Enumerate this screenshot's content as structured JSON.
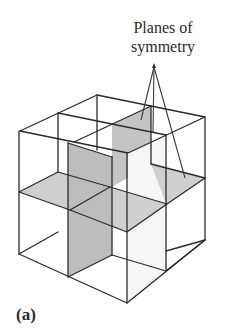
{
  "figure": {
    "annotation_line1": "Planes of",
    "annotation_line2": "symmetry",
    "panel_label": "(a)"
  },
  "colors": {
    "line": "#2b2b2b",
    "plane_shade_horizontal": "#cfcfcf",
    "plane_shade_vertical": "#bdbdbd",
    "background": "#ffffff"
  },
  "diagram": {
    "pointer_apex": [
      154,
      67
    ],
    "pointer_targets": [
      [
        142,
        128
      ],
      [
        153,
        138
      ],
      [
        185,
        180
      ]
    ]
  }
}
